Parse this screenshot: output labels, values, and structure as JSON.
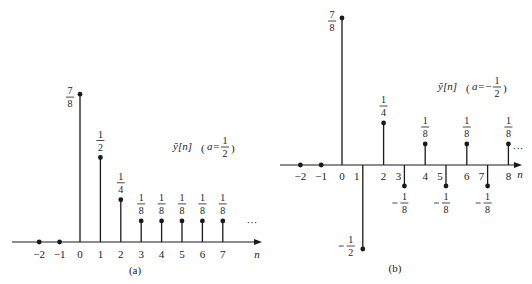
{
  "chart_data": [
    {
      "type": "stem",
      "caption": "(a)",
      "title": "ỹ[n] (a = 1/2)",
      "xlabel": "n",
      "ylabel": "",
      "x_ticks": [
        "−2",
        "−1",
        "0",
        "1",
        "2",
        "3",
        "4",
        "5",
        "6",
        "7"
      ],
      "x": [
        -2,
        -1,
        0,
        1,
        2,
        3,
        4,
        5,
        6,
        7
      ],
      "values": [
        0,
        0,
        0.875,
        0.5,
        0.25,
        0.125,
        0.125,
        0.125,
        0.125,
        0.125
      ],
      "value_labels": [
        "",
        "",
        "7/8",
        "1/2",
        "1/4",
        "1/8",
        "1/8",
        "1/8",
        "1/8",
        "1/8"
      ],
      "continuation": "...",
      "grid": false
    },
    {
      "type": "stem",
      "caption": "(b)",
      "title": "ỹ[n] (a = −1/2)",
      "xlabel": "n",
      "ylabel": "",
      "x_ticks": [
        "−2",
        "−1",
        "0",
        "1",
        "2",
        "3",
        "4",
        "5",
        "6",
        "7",
        "8"
      ],
      "x": [
        -2,
        -1,
        0,
        1,
        2,
        3,
        4,
        5,
        6,
        7,
        8
      ],
      "values": [
        0,
        0,
        0.875,
        -0.5,
        0.25,
        -0.125,
        0.125,
        -0.125,
        0.125,
        -0.125,
        0.125
      ],
      "value_labels": [
        "",
        "",
        "7/8",
        "−1/2",
        "1/4",
        "−1/8",
        "1/8",
        "−1/8",
        "1/8",
        "−1/8",
        "1/8"
      ],
      "continuation": "...",
      "grid": false
    }
  ],
  "plot_a": {
    "caption": "(a)",
    "axis_label": "n",
    "legend": {
      "prefix": "ỹ[n]",
      "a_eq": "a=",
      "num": "1",
      "den": "2"
    },
    "ellipsis": "···"
  },
  "plot_b": {
    "caption": "(b)",
    "axis_label": "n",
    "legend": {
      "prefix": "ỹ[n]",
      "a_eq": "a=−",
      "num": "1",
      "den": "2"
    },
    "ellipsis": "···"
  }
}
